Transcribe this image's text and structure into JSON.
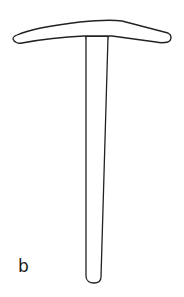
{
  "figure": {
    "panel_label": "b",
    "stroke_color": "#222222",
    "background_color": "#ffffff"
  }
}
